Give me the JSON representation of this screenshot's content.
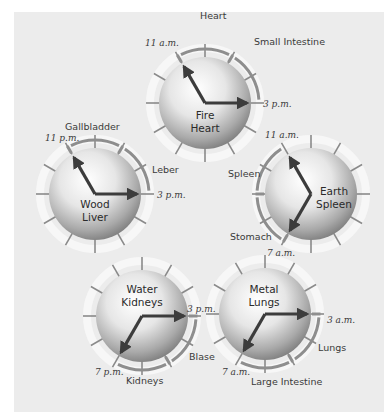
{
  "colors": {
    "background": "#ececec",
    "ring": "#f7f7f7",
    "tick": "#8a8a8a",
    "arc": "#8e8e8e",
    "hand": "#3c3c3c",
    "sphere_light": "#ffffff",
    "sphere_dark": "#8c8c8c"
  },
  "clocks": [
    {
      "id": "fire",
      "element": "Fire",
      "organ": "Heart",
      "center": [
        205,
        103
      ],
      "hands": [
        {
          "hour": 11,
          "label": "11 a.m."
        },
        {
          "hour": 3,
          "label": "3 p.m."
        }
      ],
      "arcs": [
        {
          "from": 11,
          "to": 1,
          "label": "Heart"
        },
        {
          "from": 1,
          "to": 3,
          "label": "Small Intestine"
        }
      ]
    },
    {
      "id": "wood",
      "element": "Wood",
      "organ": "Liver",
      "center": [
        95,
        194
      ],
      "hands": [
        {
          "hour": 11,
          "label": "11 p.m."
        },
        {
          "hour": 3,
          "label": "3 p.m."
        }
      ],
      "arcs": [
        {
          "from": 11,
          "to": 1,
          "label": "Gallbladder"
        },
        {
          "from": 1,
          "to": 3,
          "label": "Leber"
        }
      ]
    },
    {
      "id": "earth",
      "element": "Earth",
      "organ": "Spleen",
      "center": [
        311,
        194
      ],
      "hands": [
        {
          "hour": 11,
          "label": "11 a.m."
        },
        {
          "hour": 7,
          "label": "7 a.m."
        }
      ],
      "arcs": [
        {
          "from": 9,
          "to": 11,
          "label": "Spleen"
        },
        {
          "from": 7,
          "to": 9,
          "label": "Stomach"
        }
      ]
    },
    {
      "id": "water",
      "element": "Water",
      "organ": "Kidneys",
      "center": [
        142,
        316
      ],
      "hands": [
        {
          "hour": 3,
          "label": "3 p.m."
        },
        {
          "hour": 7,
          "label": "7 p.m."
        }
      ],
      "arcs": [
        {
          "from": 3,
          "to": 5,
          "label": "Blase"
        },
        {
          "from": 5,
          "to": 7,
          "label": "Kidneys"
        }
      ]
    },
    {
      "id": "metal",
      "element": "Metal",
      "organ": "Lungs",
      "center": [
        265,
        314
      ],
      "hands": [
        {
          "hour": 3,
          "label": "3 a.m."
        },
        {
          "hour": 7,
          "label": "7 a.m."
        }
      ],
      "arcs": [
        {
          "from": 3,
          "to": 5,
          "label": "Lungs"
        },
        {
          "from": 5,
          "to": 7,
          "label": "Large Intestine"
        }
      ]
    }
  ],
  "labels": {
    "fire_heart": "Heart",
    "fire_small_intestine": "Small Intestine",
    "fire_time_11": "11 a.m.",
    "fire_time_3": "3 p.m.",
    "fire_element": "Fire",
    "fire_organ": "Heart",
    "wood_gallbladder": "Gallbladder",
    "wood_leber": "Leber",
    "wood_time_11": "11 p.m.",
    "wood_time_3": "3 p.m.",
    "wood_element": "Wood",
    "wood_organ": "Liver",
    "earth_spleen": "Spleen",
    "earth_stomach": "Stomach",
    "earth_time_11": "11 a.m.",
    "earth_time_7": "7 a.m.",
    "earth_element": "Earth",
    "earth_organ": "Spleen",
    "water_blase": "Blase",
    "water_kidneys": "Kidneys",
    "water_time_3": "3 p.m.",
    "water_time_7": "7 p.m.",
    "water_element": "Water",
    "water_organ": "Kidneys",
    "metal_lungs": "Lungs",
    "metal_large_intestine": "Large Intestine",
    "metal_time_3": "3 a.m.",
    "metal_time_7": "7 a.m.",
    "metal_element": "Metal",
    "metal_organ": "Lungs"
  }
}
